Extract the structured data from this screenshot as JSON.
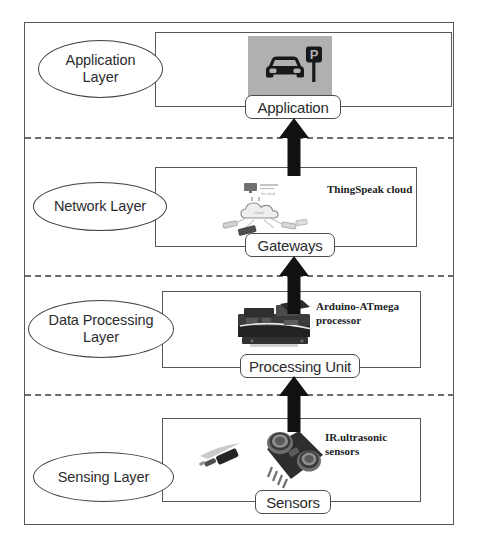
{
  "figure": {
    "outer_frame": "diagram-border"
  },
  "layers": [
    {
      "id": "application",
      "oval_label": "Application\nLayer",
      "node_label": "Application",
      "annotation": "",
      "icon": "car-parking-sign-icon"
    },
    {
      "id": "network",
      "oval_label": "Network Layer",
      "node_label": "Gateways",
      "annotation": "ThingSpeak cloud",
      "icon": "cloud-network-icon"
    },
    {
      "id": "data-processing",
      "oval_label": "Data Processing\nLayer",
      "node_label": "Processing Unit",
      "annotation": "Arduino-ATmega\nprocessor",
      "icon": "arduino-board-icon"
    },
    {
      "id": "sensing",
      "oval_label": "Sensing Layer",
      "node_label": "Sensors",
      "annotation": "IR.ultrasonic\nsensors",
      "icon": "ultrasonic-sensor-icon"
    }
  ],
  "arrows": [
    {
      "name": "arrow-sensing-to-processing",
      "direction": "up"
    },
    {
      "name": "arrow-processing-to-network",
      "direction": "up"
    },
    {
      "name": "arrow-network-to-application",
      "direction": "up"
    }
  ],
  "separators": [
    {
      "name": "separator-application-network"
    },
    {
      "name": "separator-network-processing"
    },
    {
      "name": "separator-processing-sensing"
    }
  ],
  "colors": {
    "frame": "#57585a",
    "text": "#2b2c2e",
    "arrow": "#111111",
    "app_tile_bg": "#b0b0b0",
    "annotation": "#1c1d1f"
  }
}
